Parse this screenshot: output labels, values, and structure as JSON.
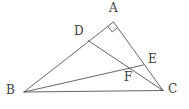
{
  "figure": {
    "background_color": "#ffffff",
    "line_color": "#4a4a4a",
    "label_color": "#3c3c3c",
    "width": 189,
    "height": 109
  },
  "points": {
    "A": {
      "label": "A",
      "x": 113.5,
      "y": 22.0,
      "label_x": 109,
      "label_y": 2
    },
    "B": {
      "label": "B",
      "x": 24.0,
      "y": 92.0,
      "label_x": 6,
      "label_y": 84
    },
    "C": {
      "label": "C",
      "x": 163.0,
      "y": 90.5,
      "label_x": 168,
      "label_y": 83
    },
    "D": {
      "label": "D",
      "x": 88.0,
      "y": 40.5,
      "label_x": 74,
      "label_y": 25
    },
    "E": {
      "label": "E",
      "x": 143.5,
      "y": 65.0,
      "label_x": 148,
      "label_y": 53
    },
    "F": {
      "label": "F",
      "x": 129.0,
      "y": 71.0,
      "label_x": 124,
      "label_y": 71
    }
  },
  "segments": [
    {
      "name": "segment-AB",
      "from": "A",
      "to": "B"
    },
    {
      "name": "segment-AC",
      "from": "A",
      "to": "C"
    },
    {
      "name": "segment-BC",
      "from": "B",
      "to": "C"
    },
    {
      "name": "segment-DC",
      "from": "D",
      "to": "C"
    },
    {
      "name": "segment-BE",
      "from": "B",
      "to": "E"
    }
  ],
  "angle_marks": [
    {
      "name": "right-angle-at-A",
      "vertex": "A",
      "type": "right-angle-square",
      "size": 7
    }
  ],
  "labels": {
    "A": "A",
    "B": "B",
    "C": "C",
    "D": "D",
    "E": "E",
    "F": "F"
  }
}
